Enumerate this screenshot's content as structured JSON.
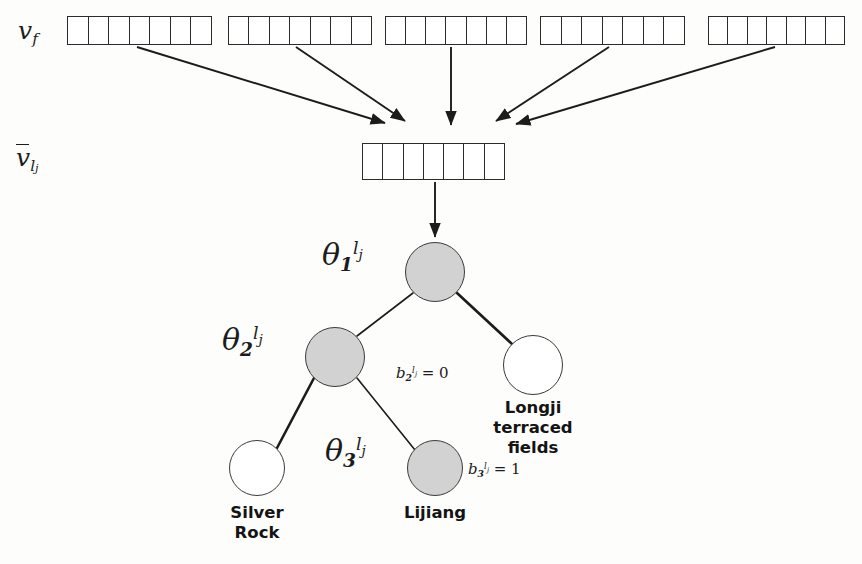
{
  "figure": {
    "background_color": "#fdfdfc",
    "node_fill_color": "#d2d2d2",
    "node_stroke_color": "#3a3a3a",
    "line_color": "#1c1c1c"
  },
  "input_layer": {
    "label_v": "v",
    "label_sub": "f",
    "cells_per_vector": 7,
    "vectors": [
      {
        "name": "vf-vector-1",
        "x": 67,
        "y": 16,
        "width": 145,
        "height": 29
      },
      {
        "name": "vf-vector-2",
        "x": 228,
        "y": 16,
        "width": 144,
        "height": 29
      },
      {
        "name": "vf-vector-3",
        "x": 385,
        "y": 16,
        "width": 142,
        "height": 29
      },
      {
        "name": "vf-vector-4",
        "x": 540,
        "y": 16,
        "width": 145,
        "height": 29
      },
      {
        "name": "vf-vector-5",
        "x": 708,
        "y": 16,
        "width": 137,
        "height": 29
      }
    ]
  },
  "aggregate_layer": {
    "label_v": "v",
    "label_sub_l": "l",
    "label_sub_j": "j",
    "cells": 7,
    "vector": {
      "x": 362,
      "y": 143,
      "width": 143,
      "height": 37
    }
  },
  "arrows": [
    {
      "name": "arrow-from-vector-1",
      "x1": 137,
      "y1": 47,
      "x2": 385,
      "y2": 123
    },
    {
      "name": "arrow-from-vector-2",
      "x1": 296,
      "y1": 47,
      "x2": 405,
      "y2": 121
    },
    {
      "name": "arrow-from-vector-3",
      "x1": 451,
      "y1": 47,
      "x2": 451,
      "y2": 125
    },
    {
      "name": "arrow-from-vector-4",
      "x1": 609,
      "y1": 47,
      "x2": 496,
      "y2": 121
    },
    {
      "name": "arrow-from-vector-5",
      "x1": 775,
      "y1": 47,
      "x2": 516,
      "y2": 124
    },
    {
      "name": "arrow-to-root-node",
      "x1": 435,
      "y1": 182,
      "x2": 435,
      "y2": 237
    }
  ],
  "tree": {
    "nodes": [
      {
        "name": "node-root-theta1",
        "cx": 435,
        "cy": 272,
        "r": 30,
        "fill": "filled",
        "theta_label": {
          "base": "θ",
          "sub": "1",
          "sup_l": "l",
          "sup_j": "j",
          "x": 322,
          "y": 240
        }
      },
      {
        "name": "node-theta2",
        "cx": 335,
        "cy": 357,
        "r": 30,
        "fill": "filled",
        "theta_label": {
          "base": "θ",
          "sub": "2",
          "sup_l": "l",
          "sup_j": "j",
          "x": 222,
          "y": 325
        }
      },
      {
        "name": "node-longji-terraced-fields",
        "cx": 533,
        "cy": 365,
        "r": 30,
        "fill": "hollow",
        "theta_label": null
      },
      {
        "name": "node-silver-rock",
        "cx": 257,
        "cy": 468,
        "r": 28,
        "fill": "hollow",
        "theta_label": null
      },
      {
        "name": "node-lijiang-theta3",
        "cx": 435,
        "cy": 468,
        "r": 28,
        "fill": "filled",
        "theta_label": {
          "base": "θ",
          "sub": "3",
          "sup_l": "l",
          "sup_j": "j",
          "x": 325,
          "y": 436
        }
      }
    ],
    "edges": [
      {
        "name": "edge-root-to-theta2",
        "x1": 413,
        "y1": 293,
        "x2": 357,
        "y2": 336,
        "width": 1.6
      },
      {
        "name": "edge-root-to-longji",
        "x1": 457,
        "y1": 293,
        "x2": 512,
        "y2": 344,
        "width": 2.6
      },
      {
        "name": "edge-theta2-to-silver-rock",
        "x1": 314,
        "y1": 378,
        "x2": 277,
        "y2": 448,
        "width": 2.6
      },
      {
        "name": "edge-theta2-to-lijiang",
        "x1": 357,
        "y1": 378,
        "x2": 415,
        "y2": 450,
        "width": 1.6
      }
    ],
    "branch_labels": [
      {
        "name": "branch-label-b2",
        "base": "b",
        "sub": "2",
        "sup_l": "l",
        "sup_j": "j",
        "value": "= 0",
        "x": 396,
        "y": 366
      },
      {
        "name": "branch-label-b3",
        "base": "b",
        "sub": "3",
        "sup_l": "l",
        "sup_j": "j",
        "value": "= 1",
        "x": 468,
        "y": 462
      }
    ],
    "leaf_labels": [
      {
        "name": "leaf-label-longji",
        "text": "Longji\nterraced\nfields",
        "x": 473,
        "y": 398,
        "width": 120
      },
      {
        "name": "leaf-label-silver-rock",
        "text": "Silver\nRock",
        "x": 197,
        "y": 503,
        "width": 120
      },
      {
        "name": "leaf-label-lijiang",
        "text": "Lijiang",
        "x": 375,
        "y": 503,
        "width": 120
      }
    ]
  }
}
